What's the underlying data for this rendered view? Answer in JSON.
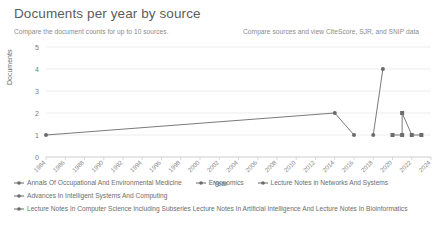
{
  "header": {
    "title": "Documents per year by source",
    "subtitle": "Compare the document counts for up to 10 sources.",
    "cite_link": "Compare sources and view CiteScore, SJR, and SNIP data"
  },
  "chart_data": {
    "type": "line",
    "title": "Documents per year by source",
    "xlabel": "Year",
    "ylabel": "Documents",
    "ylim": [
      0,
      5
    ],
    "yticks": [
      0,
      1,
      2,
      3,
      4,
      5
    ],
    "xlim": [
      1984,
      2024
    ],
    "grid": true,
    "legend_position": "bottom",
    "tick_labels": [
      "1984",
      "1986",
      "1988",
      "1990",
      "1992",
      "1994",
      "1996",
      "1998",
      "2000",
      "2002",
      "2004",
      "2006",
      "2008",
      "2010",
      "2012",
      "2014",
      "2016",
      "2018",
      "2020",
      "2022",
      "2024"
    ],
    "series": [
      {
        "name": "Annals Of Occupational And Environmental Medicine",
        "marker": "circle",
        "color": "#6b6b6b",
        "points": [
          [
            1984,
            1
          ],
          [
            2014,
            2
          ],
          [
            2016,
            1
          ]
        ]
      },
      {
        "name": "Ergonomics",
        "marker": "circle",
        "color": "#6b6b6b",
        "points": [
          [
            2018,
            1
          ],
          [
            2019,
            4
          ]
        ]
      },
      {
        "name": "Lecture Notes in Networks And Systems",
        "marker": "square",
        "color": "#6b6b6b",
        "points": [
          [
            2020,
            1
          ],
          [
            2021,
            1
          ],
          [
            2021,
            2
          ],
          [
            2022,
            1
          ],
          [
            2023,
            1
          ]
        ]
      },
      {
        "name": "Advances In Intelligent Systems And Computing",
        "marker": "circle",
        "color": "#6b6b6b",
        "points": []
      },
      {
        "name": "Lecture Notes In Computer Science Including Subseries Lecture Notes In Artificial Intelligence And Lecture Notes In Bioinformatics",
        "marker": "circle",
        "color": "#6b6b6b",
        "points": []
      }
    ]
  },
  "legend": {
    "items": [
      {
        "label": "Annals Of Occupational And Environmental Medicine"
      },
      {
        "label": "Ergonomics"
      },
      {
        "label": "Lecture Notes in Networks And Systems"
      },
      {
        "label": "Advances In Intelligent Systems And Computing"
      },
      {
        "label": "Lecture Notes In Computer Science Including Subseries Lecture Notes In Artificial Intelligence And Lecture Notes In Bioinformatics"
      }
    ]
  }
}
